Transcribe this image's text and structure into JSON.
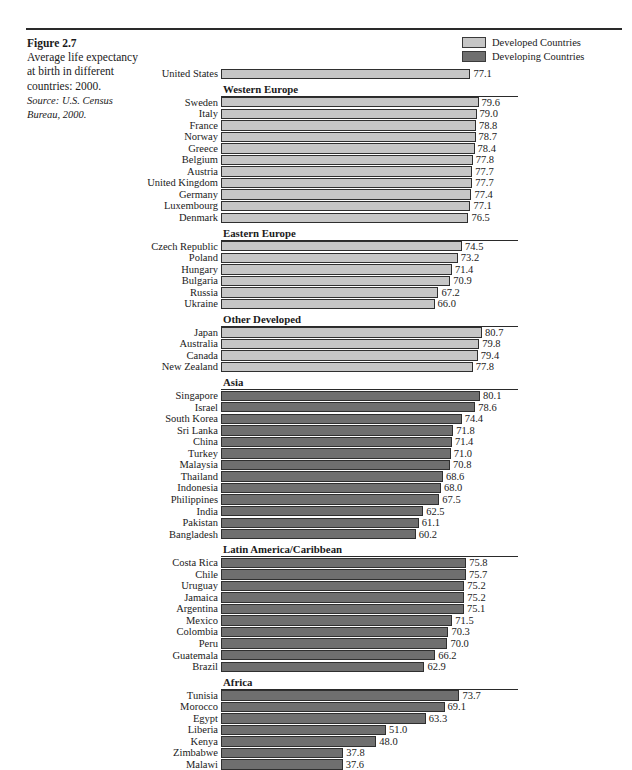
{
  "figure": {
    "number": "Figure 2.7",
    "description": "Average life expectancy at birth in different countries: 2000.",
    "source": "Source: U.S. Census Bureau, 2000."
  },
  "legend": {
    "items": [
      {
        "label": "Developed Countries",
        "color": "#c6c6c6",
        "key": "developed"
      },
      {
        "label": "Developing Countries",
        "color": "#6f6f6f",
        "key": "developing"
      }
    ]
  },
  "chart_data": {
    "type": "bar",
    "orientation": "horizontal",
    "title": "Average life expectancy at birth in different countries: 2000.",
    "xlabel": "",
    "ylabel": "",
    "xlim": [
      0,
      85
    ],
    "grid": false,
    "legend_position": "top-right",
    "legend": [
      "Developed Countries",
      "Developing Countries"
    ],
    "value_format": "one-decimal",
    "sections": [
      {
        "name": "",
        "header": null,
        "group": "developed",
        "categories": [
          "United States"
        ],
        "values": [
          77.1
        ]
      },
      {
        "name": "Western Europe",
        "header": "Western Europe",
        "group": "developed",
        "categories": [
          "Sweden",
          "Italy",
          "France",
          "Norway",
          "Greece",
          "Belgium",
          "Austria",
          "United Kingdom",
          "Germany",
          "Luxembourg",
          "Denmark"
        ],
        "values": [
          79.6,
          79.0,
          78.8,
          78.7,
          78.4,
          77.8,
          77.7,
          77.7,
          77.4,
          77.1,
          76.5
        ]
      },
      {
        "name": "Eastern Europe",
        "header": "Eastern Europe",
        "group": "developed",
        "categories": [
          "Czech Republic",
          "Poland",
          "Hungary",
          "Bulgaria",
          "Russia",
          "Ukraine"
        ],
        "values": [
          74.5,
          73.2,
          71.4,
          70.9,
          67.2,
          66.0
        ]
      },
      {
        "name": "Other Developed",
        "header": "Other Developed",
        "group": "developed",
        "categories": [
          "Japan",
          "Australia",
          "Canada",
          "New Zealand"
        ],
        "values": [
          80.7,
          79.8,
          79.4,
          77.8
        ]
      },
      {
        "name": "Asia",
        "header": "Asia",
        "group": "developing",
        "categories": [
          "Singapore",
          "Israel",
          "South Korea",
          "Sri Lanka",
          "China",
          "Turkey",
          "Malaysia",
          "Thailand",
          "Indonesia",
          "Philippines",
          "India",
          "Pakistan",
          "Bangladesh"
        ],
        "values": [
          80.1,
          78.6,
          74.4,
          71.8,
          71.4,
          71.0,
          70.8,
          68.6,
          68.0,
          67.5,
          62.5,
          61.1,
          60.2
        ]
      },
      {
        "name": "Latin America/Caribbean",
        "header": "Latin America/Caribbean",
        "group": "developing",
        "categories": [
          "Costa Rica",
          "Chile",
          "Uruguay",
          "Jamaica",
          "Argentina",
          "Mexico",
          "Colombia",
          "Peru",
          "Guatemala",
          "Brazil"
        ],
        "values": [
          75.8,
          75.7,
          75.2,
          75.2,
          75.1,
          71.5,
          70.3,
          70.0,
          66.2,
          62.9
        ]
      },
      {
        "name": "Africa",
        "header": "Africa",
        "group": "developing",
        "categories": [
          "Tunisia",
          "Morocco",
          "Egypt",
          "Liberia",
          "Kenya",
          "Zimbabwe",
          "Malawi"
        ],
        "values": [
          73.7,
          69.1,
          63.3,
          51.0,
          48.0,
          37.8,
          37.6
        ]
      }
    ]
  }
}
